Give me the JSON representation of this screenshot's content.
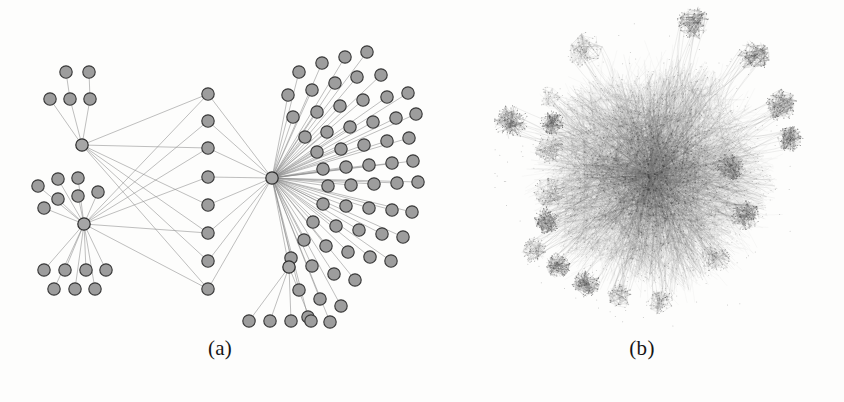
{
  "figure": {
    "background_color": "#fdfdfc",
    "width": 844,
    "height": 402,
    "node_fill": "#9d9d9d",
    "node_stroke": "#3a3a3a",
    "edge_color": "#8a8a8a"
  },
  "panels": [
    {
      "id": "a",
      "caption": "(a)",
      "description": "Sparse hierarchical star network with visible nodes and edges"
    },
    {
      "id": "b",
      "caption": "(b)",
      "description": "Dense hairball network with peripheral clusters"
    }
  ],
  "chart_data": {
    "type": "graph",
    "title": "",
    "panels": [
      {
        "id": "a",
        "label": "(a)",
        "layout": "radial-hierarchical",
        "node_count": 108,
        "edge_count": 123,
        "node_radius": 6.2,
        "hub_radius": 6.2,
        "hubs": [
          {
            "id": "H1",
            "x": 82,
            "y": 145,
            "degree": 13
          },
          {
            "id": "H2",
            "x": 84,
            "y": 224,
            "degree": 19
          },
          {
            "id": "H3",
            "x": 272,
            "y": 178,
            "degree": 63
          },
          {
            "id": "H4",
            "x": 289,
            "y": 267,
            "degree": 5
          }
        ],
        "node_groups": [
          {
            "name": "upper-left-leaves-row1",
            "parent": "H1",
            "nodes": [
              [
                66,
                72
              ],
              [
                89,
                72
              ]
            ]
          },
          {
            "name": "upper-left-leaves-row2",
            "parent": "H1",
            "nodes": [
              [
                50,
                99
              ],
              [
                70,
                99
              ],
              [
                90,
                99
              ]
            ]
          },
          {
            "name": "mid-left-leaves",
            "parent": "H2",
            "nodes": [
              [
                38,
                186
              ],
              [
                58,
                179
              ],
              [
                78,
                178
              ],
              [
                58,
                199
              ],
              [
                78,
                196
              ],
              [
                98,
                192
              ],
              [
                44,
                208
              ]
            ]
          },
          {
            "name": "lower-left-leaves-row1",
            "parent": "H2",
            "nodes": [
              [
                44,
                270
              ],
              [
                65,
                270
              ],
              [
                86,
                270
              ],
              [
                106,
                270
              ]
            ]
          },
          {
            "name": "lower-left-leaves-row2",
            "parent": "H2",
            "nodes": [
              [
                54,
                289
              ],
              [
                75,
                289
              ],
              [
                95,
                289
              ]
            ]
          },
          {
            "name": "center-column",
            "parents": [
              "H1",
              "H2",
              "H3"
            ],
            "nodes": [
              [
                208,
                94
              ],
              [
                208,
                121
              ],
              [
                208,
                148
              ],
              [
                208,
                177
              ],
              [
                208,
                205
              ],
              [
                208,
                233
              ],
              [
                208,
                261
              ],
              [
                208,
                289
              ]
            ]
          },
          {
            "name": "right-fan-upper",
            "parent": "H3",
            "nodes": [
              [
                299,
                72
              ],
              [
                322,
                63
              ],
              [
                345,
                57
              ],
              [
                367,
                52
              ],
              [
                288,
                95
              ],
              [
                312,
                90
              ],
              [
                335,
                83
              ],
              [
                357,
                77
              ],
              [
                381,
                75
              ],
              [
                293,
                117
              ],
              [
                317,
                112
              ],
              [
                340,
                106
              ],
              [
                363,
                100
              ],
              [
                387,
                97
              ],
              [
                408,
                93
              ],
              [
                305,
                137
              ],
              [
                327,
                132
              ],
              [
                350,
                127
              ],
              [
                373,
                122
              ],
              [
                396,
                118
              ],
              [
                416,
                114
              ],
              [
                317,
                152
              ],
              [
                341,
                149
              ],
              [
                364,
                145
              ],
              [
                387,
                141
              ],
              [
                409,
                138
              ]
            ]
          },
          {
            "name": "right-fan-middle",
            "parent": "H3",
            "nodes": [
              [
                323,
                169
              ],
              [
                346,
                167
              ],
              [
                369,
                165
              ],
              [
                392,
                163
              ],
              [
                413,
                161
              ],
              [
                328,
                186
              ],
              [
                351,
                185
              ],
              [
                374,
                184
              ],
              [
                397,
                183
              ],
              [
                418,
                182
              ]
            ]
          },
          {
            "name": "right-fan-lower",
            "parent": "H3",
            "nodes": [
              [
                323,
                204
              ],
              [
                346,
                206
              ],
              [
                369,
                208
              ],
              [
                392,
                210
              ],
              [
                412,
                212
              ],
              [
                313,
                222
              ],
              [
                336,
                226
              ],
              [
                359,
                230
              ],
              [
                382,
                234
              ],
              [
                403,
                237
              ],
              [
                304,
                240
              ],
              [
                326,
                246
              ],
              [
                348,
                252
              ],
              [
                370,
                257
              ],
              [
                391,
                261
              ],
              [
                291,
                258
              ],
              [
                312,
                266
              ],
              [
                334,
                274
              ],
              [
                355,
                280
              ],
              [
                299,
                290
              ],
              [
                320,
                299
              ],
              [
                341,
                306
              ],
              [
                308,
                317
              ],
              [
                330,
                322
              ]
            ]
          },
          {
            "name": "bottom-leaves",
            "parent": "H4",
            "nodes": [
              [
                249,
                321
              ],
              [
                270,
                321
              ],
              [
                291,
                321
              ],
              [
                311,
                321
              ]
            ]
          }
        ]
      },
      {
        "id": "b",
        "label": "(b)",
        "layout": "force-directed-hairball",
        "approx_node_count": 6000,
        "approx_edge_count": 28000,
        "core_center": [
          652,
          175
        ],
        "core_radius": 108,
        "peripheral_clusters": [
          {
            "x": 694,
            "y": 23,
            "r": 17,
            "density": "high"
          },
          {
            "x": 754,
            "y": 56,
            "r": 16,
            "density": "high"
          },
          {
            "x": 585,
            "y": 50,
            "r": 18,
            "density": "medium"
          },
          {
            "x": 781,
            "y": 105,
            "r": 16,
            "density": "high"
          },
          {
            "x": 790,
            "y": 139,
            "r": 13,
            "density": "high"
          },
          {
            "x": 511,
            "y": 122,
            "r": 17,
            "density": "high"
          },
          {
            "x": 552,
            "y": 123,
            "r": 12,
            "density": "high"
          },
          {
            "x": 549,
            "y": 150,
            "r": 15,
            "density": "medium"
          },
          {
            "x": 550,
            "y": 192,
            "r": 16,
            "density": "medium"
          },
          {
            "x": 549,
            "y": 97,
            "r": 11,
            "density": "low"
          },
          {
            "x": 547,
            "y": 221,
            "r": 13,
            "density": "high"
          },
          {
            "x": 534,
            "y": 250,
            "r": 13,
            "density": "medium"
          },
          {
            "x": 558,
            "y": 265,
            "r": 13,
            "density": "high"
          },
          {
            "x": 586,
            "y": 283,
            "r": 14,
            "density": "high"
          },
          {
            "x": 620,
            "y": 296,
            "r": 13,
            "density": "medium"
          },
          {
            "x": 660,
            "y": 302,
            "r": 13,
            "density": "medium"
          },
          {
            "x": 716,
            "y": 258,
            "r": 15,
            "density": "medium"
          },
          {
            "x": 745,
            "y": 215,
            "r": 15,
            "density": "high"
          },
          {
            "x": 730,
            "y": 167,
            "r": 14,
            "density": "high"
          }
        ]
      }
    ]
  }
}
